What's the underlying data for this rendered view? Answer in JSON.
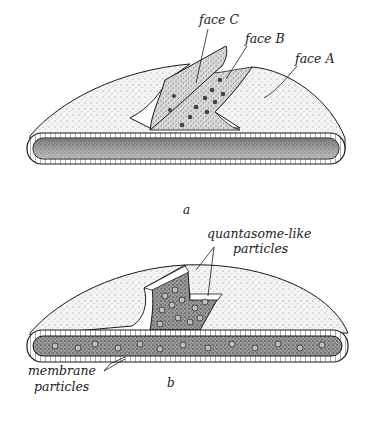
{
  "figure": {
    "panel_a": {
      "caption": "a",
      "labels": {
        "face_c": "face C",
        "face_b": "face B",
        "face_a": "face A"
      }
    },
    "panel_b": {
      "caption": "b",
      "labels": {
        "quantasome_line1": "quantasome-like",
        "quantasome_line2": "particles",
        "membrane_line1": "membrane",
        "membrane_line2": "particles"
      }
    }
  },
  "colors": {
    "ink": "#1a1a1a",
    "stipple_light": "#e8e8e8",
    "stipple_dark": "#8a8a8a",
    "background": "#ffffff"
  }
}
